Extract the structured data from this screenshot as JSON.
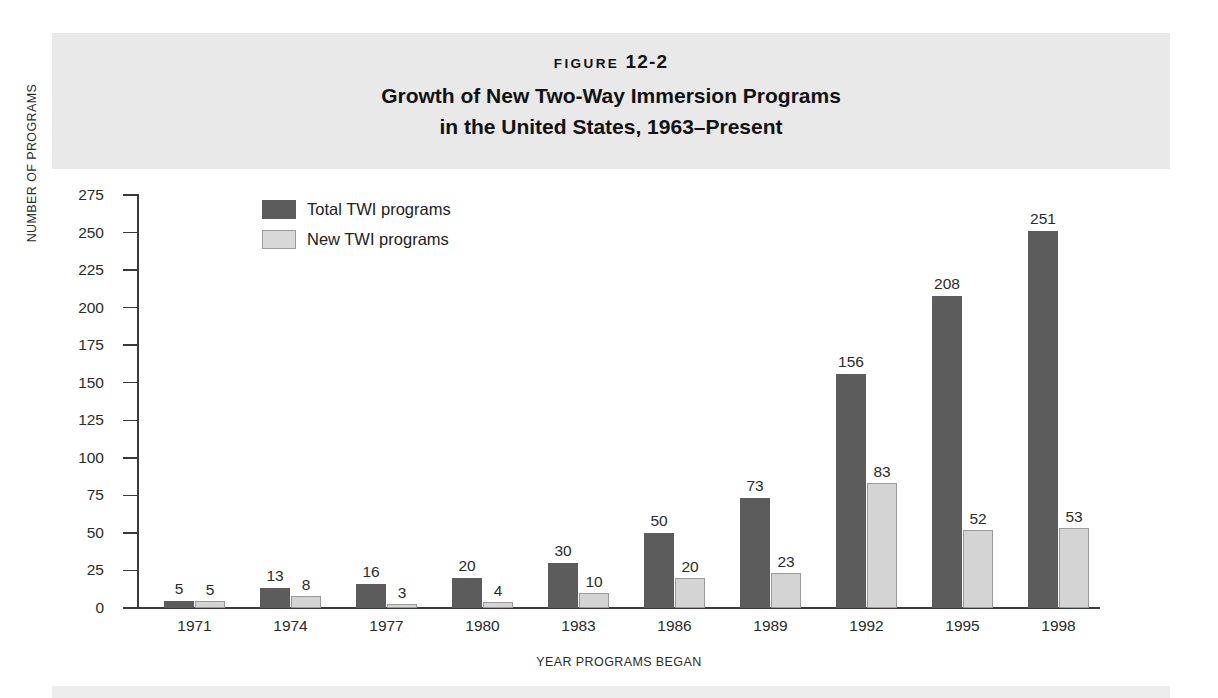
{
  "header": {
    "figure_word": "FIGURE",
    "figure_id": "12-2",
    "title_line1": "Growth of New Two-Way Immersion Programs",
    "title_line2": "in the United States, 1963–Present"
  },
  "colors": {
    "total_bar": "#5c5c5c",
    "new_bar": "#d4d4d4",
    "band": "#e9e9e9",
    "axis": "#3a3a3a"
  },
  "chart_data": {
    "type": "bar",
    "title": "Growth of New Two-Way Immersion Programs in the United States, 1963–Present",
    "xlabel": "YEAR PROGRAMS BEGAN",
    "ylabel": "NUMBER OF PROGRAMS",
    "ylim": [
      0,
      275
    ],
    "ytick_step": 25,
    "yticks": [
      0,
      25,
      50,
      75,
      100,
      125,
      150,
      175,
      200,
      225,
      250,
      275
    ],
    "ytick_labels": [
      "0",
      "25",
      "50",
      "75",
      "100",
      "125",
      "150",
      "175",
      "200",
      "225",
      "250",
      "275"
    ],
    "grid": false,
    "legend_position": "upper-left-inside",
    "categories": [
      "1971",
      "1974",
      "1977",
      "1980",
      "1983",
      "1986",
      "1989",
      "1992",
      "1995",
      "1998"
    ],
    "series": [
      {
        "name": "Total TWI programs",
        "color": "#5c5c5c",
        "values": [
          5,
          13,
          16,
          20,
          30,
          50,
          73,
          156,
          208,
          251
        ],
        "labels": [
          "5",
          "13",
          "16",
          "20",
          "30",
          "50",
          "73",
          "156",
          "208",
          "251"
        ]
      },
      {
        "name": "New TWI programs",
        "color": "#d4d4d4",
        "values": [
          5,
          8,
          3,
          4,
          10,
          20,
          23,
          83,
          52,
          53
        ],
        "labels": [
          "5",
          "8",
          "3",
          "4",
          "10",
          "20",
          "23",
          "83",
          "52",
          "53"
        ]
      }
    ]
  }
}
